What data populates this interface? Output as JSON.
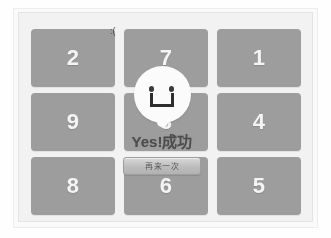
{
  "app": {
    "title": "Number Puzzle Game",
    "background_color": "#fefefe",
    "panel_color": "#f2f2f2"
  },
  "board": {
    "rows": 3,
    "columns": 3,
    "tile_color": "#9d9d9d",
    "tile_text_color": "#f4f4f4",
    "tiles": [
      {
        "label": "2",
        "name": "tile-2"
      },
      {
        "label": "7",
        "name": "tile-7"
      },
      {
        "label": "1",
        "name": "tile-1"
      },
      {
        "label": "9",
        "name": "tile-9"
      },
      {
        "label": "3",
        "name": "tile-3"
      },
      {
        "label": "4",
        "name": "tile-4"
      },
      {
        "label": "8",
        "name": "tile-8"
      },
      {
        "label": "6",
        "name": "tile-6"
      },
      {
        "label": "5",
        "name": "tile-5"
      }
    ]
  },
  "sad_face": {
    "glyph": ":(",
    "icon": "sad-face-icon"
  },
  "success_overlay": {
    "icon": "smiley-face-icon",
    "message": "Yes!成功",
    "message_color": "#4c4c4c",
    "button_label": "再来一次"
  }
}
